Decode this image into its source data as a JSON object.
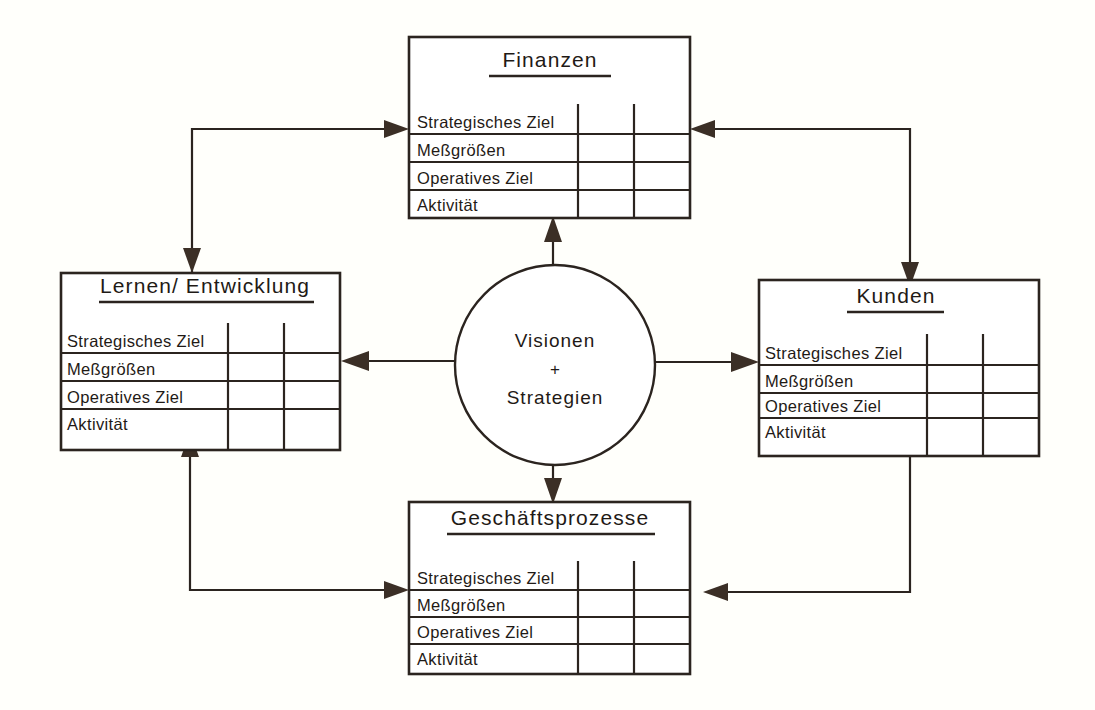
{
  "diagram": {
    "title_visible": false,
    "type": "balanced-scorecard",
    "background_color": "#fffffb",
    "line_color": "#2b241f"
  },
  "center": {
    "line1": "Visionen",
    "plus": "+",
    "line2": "Strategien"
  },
  "perspectives": {
    "finance": {
      "title": "Finanzen",
      "rows": [
        "Strategisches Ziel",
        "Meßgrößen",
        "Operatives Ziel",
        "Aktivität"
      ]
    },
    "learning": {
      "title": "Lernen/ Entwicklung",
      "rows": [
        "Strategisches Ziel",
        "Meßgrößen",
        "Operatives Ziel",
        "Aktivität"
      ]
    },
    "customer": {
      "title": "Kunden",
      "rows": [
        "Strategisches Ziel",
        "Meßgrößen",
        "Operatives Ziel",
        "Aktivität"
      ]
    },
    "process": {
      "title": "Geschäftsprozesse",
      "rows": [
        "Strategisches Ziel",
        "Meßgrößen",
        "Operatives Ziel",
        "Aktivität"
      ]
    }
  },
  "connectors": [
    {
      "name": "center-to-finance",
      "direction": "up"
    },
    {
      "name": "center-to-process",
      "direction": "down"
    },
    {
      "name": "center-to-learning",
      "direction": "left"
    },
    {
      "name": "center-to-customer",
      "direction": "right"
    },
    {
      "name": "learning-finance-elbow",
      "direction": "double"
    },
    {
      "name": "finance-customer-elbow",
      "direction": "double"
    },
    {
      "name": "learning-process-elbow",
      "direction": "double"
    },
    {
      "name": "customer-process-elbow",
      "direction": "double"
    }
  ]
}
